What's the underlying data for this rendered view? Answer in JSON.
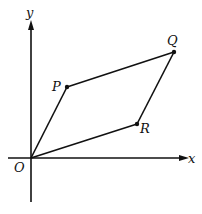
{
  "diagram": {
    "type": "parallelogram-vectors",
    "axes": {
      "x_label": "x",
      "y_label": "y",
      "origin_label": "O"
    },
    "points": [
      {
        "id": "O",
        "label": "O"
      },
      {
        "id": "P",
        "label": "P"
      },
      {
        "id": "Q",
        "label": "Q"
      },
      {
        "id": "R",
        "label": "R"
      }
    ],
    "edges": [
      [
        "O",
        "P"
      ],
      [
        "P",
        "Q"
      ],
      [
        "Q",
        "R"
      ],
      [
        "R",
        "O"
      ]
    ],
    "colors": {
      "stroke": "#111111",
      "background": "#ffffff"
    }
  }
}
